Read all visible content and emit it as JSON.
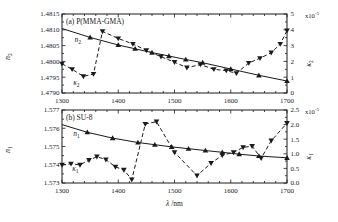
{
  "figure": {
    "xlabel": {
      "symbol": "λ",
      "rest": " /nm"
    },
    "background": "#ffffff",
    "ink_color": "#1a1a1a"
  },
  "chart_data": [
    {
      "type": "line",
      "panel_label": "(a) P(MMA-GMA)",
      "xlim": [
        1300,
        1700
      ],
      "x_major_ticks": [
        1300,
        1400,
        1500,
        1600,
        1700
      ],
      "x_tick_labels": [
        "1300",
        "1400",
        "1500",
        "1600",
        "1700"
      ],
      "x_minor_step": 20,
      "grid": false,
      "left_axis": {
        "label_main": "n",
        "label_sub": "2",
        "lim": [
          1.479,
          1.4815
        ],
        "ticks": [
          1.479,
          1.4795,
          1.48,
          1.4805,
          1.481,
          1.4815
        ],
        "tick_labels": [
          "1.4790",
          "1.4795",
          "1.4800",
          "1.4805",
          "1.4810",
          "1.4815"
        ],
        "minor_step": 0.00025
      },
      "right_axis": {
        "label_main": "κ",
        "label_sub": "2",
        "lim": [
          0,
          5
        ],
        "ticks": [
          0,
          1,
          2,
          3,
          4,
          5
        ],
        "tick_labels": [
          "0",
          "1",
          "2",
          "3",
          "4",
          "5"
        ],
        "minor_step": 0.5,
        "multiplier_base": "x10",
        "multiplier_exp": "-5"
      },
      "series": [
        {
          "name": "n2",
          "axis": "left",
          "style": "solid",
          "marker": "triangle-up",
          "line_x": [
            1300,
            1350,
            1400,
            1430,
            1460,
            1490,
            1520,
            1550,
            1600,
            1650,
            1700
          ],
          "line_y": [
            1.48104,
            1.48076,
            1.48052,
            1.4804,
            1.48028,
            1.48017,
            1.48006,
            1.47996,
            1.47976,
            1.47956,
            1.47938
          ],
          "points_x": [
            1350,
            1400,
            1430,
            1460,
            1490,
            1520,
            1550,
            1600,
            1650,
            1700
          ],
          "points_y": [
            1.48076,
            1.48052,
            1.4804,
            1.48028,
            1.48017,
            1.48006,
            1.47996,
            1.47976,
            1.47956,
            1.47938
          ],
          "annotation": {
            "main": "n",
            "sub": "2",
            "x": 1322,
            "y": 1.48062
          }
        },
        {
          "name": "kappa2",
          "axis": "right",
          "style": "dashed",
          "marker": "triangle-down",
          "line_x": [
            1300,
            1318,
            1338,
            1356,
            1372,
            1400,
            1426,
            1450,
            1476,
            1500,
            1522,
            1546,
            1570,
            1592,
            1610,
            1632,
            1652,
            1672,
            1688,
            1700
          ],
          "line_y": [
            1.85,
            1.5,
            1.05,
            1.2,
            3.9,
            3.45,
            3.1,
            2.7,
            2.3,
            1.95,
            1.6,
            1.8,
            1.5,
            1.42,
            1.25,
            1.9,
            2.2,
            2.55,
            3.1,
            3.95
          ],
          "points_x": [
            1300,
            1318,
            1338,
            1356,
            1372,
            1400,
            1426,
            1450,
            1476,
            1500,
            1522,
            1546,
            1570,
            1592,
            1610,
            1632,
            1652,
            1672,
            1688,
            1700
          ],
          "points_y": [
            1.85,
            1.5,
            1.05,
            1.2,
            3.9,
            3.45,
            3.1,
            2.7,
            2.3,
            1.95,
            1.6,
            1.8,
            1.5,
            1.42,
            1.25,
            1.9,
            2.2,
            2.55,
            3.1,
            3.95
          ],
          "annotation": {
            "main": "κ",
            "sub": "2",
            "x": 1320,
            "y": 0.52
          }
        }
      ]
    },
    {
      "type": "line",
      "panel_label": "(b) SU-8",
      "xlim": [
        1300,
        1700
      ],
      "x_major_ticks": [
        1300,
        1400,
        1500,
        1600,
        1700
      ],
      "x_tick_labels": [
        "1300",
        "1400",
        "1500",
        "1600",
        "1700"
      ],
      "x_minor_step": 20,
      "grid": false,
      "left_axis": {
        "label_main": "n",
        "label_sub": "1",
        "lim": [
          1.573,
          1.577
        ],
        "ticks": [
          1.573,
          1.574,
          1.575,
          1.576,
          1.577
        ],
        "tick_labels": [
          "1.573",
          "1.574",
          "1.575",
          "1.576",
          "1.577"
        ],
        "minor_step": 0.0005
      },
      "right_axis": {
        "label_main": "κ",
        "label_sub": "1",
        "lim": [
          0,
          2.5
        ],
        "ticks": [
          0,
          0.5,
          1,
          1.5,
          2,
          2.5
        ],
        "tick_labels": [
          "0.0",
          "0.5",
          "1.0",
          "1.5",
          "2.0",
          "2.5"
        ],
        "minor_step": 0.25,
        "multiplier_base": "x10",
        "multiplier_exp": "-5"
      },
      "series": [
        {
          "name": "n1",
          "axis": "left",
          "style": "solid",
          "marker": "triangle-up",
          "line_x": [
            1300,
            1345,
            1390,
            1435,
            1465,
            1495,
            1525,
            1555,
            1585,
            1615,
            1650,
            1700
          ],
          "line_y": [
            1.5762,
            1.57578,
            1.57546,
            1.57522,
            1.5751,
            1.57498,
            1.57488,
            1.57478,
            1.57468,
            1.57458,
            1.57448,
            1.57438
          ],
          "points_x": [
            1345,
            1390,
            1435,
            1465,
            1495,
            1525,
            1555,
            1585,
            1615,
            1650,
            1700
          ],
          "points_y": [
            1.57578,
            1.57546,
            1.57522,
            1.5751,
            1.57498,
            1.57488,
            1.57478,
            1.57468,
            1.57458,
            1.57448,
            1.57438
          ],
          "annotation": {
            "main": "n",
            "sub": "1",
            "x": 1320,
            "y": 1.5756
          }
        },
        {
          "name": "kappa1",
          "axis": "right",
          "style": "dashed",
          "marker": "triangle-down",
          "line_x": [
            1300,
            1316,
            1332,
            1348,
            1362,
            1378,
            1395,
            1410,
            1424,
            1448,
            1468,
            1500,
            1540,
            1565,
            1585,
            1605,
            1622,
            1638,
            1654,
            1672,
            1700
          ],
          "line_y": [
            0.62,
            0.66,
            0.62,
            0.78,
            0.9,
            0.8,
            0.55,
            0.45,
            0.12,
            2.02,
            2.1,
            1.05,
            0.25,
            0.68,
            0.95,
            1.05,
            1.22,
            1.26,
            0.85,
            1.45,
            2.05
          ],
          "points_x": [
            1300,
            1316,
            1332,
            1348,
            1362,
            1378,
            1395,
            1410,
            1424,
            1448,
            1468,
            1500,
            1540,
            1565,
            1585,
            1605,
            1622,
            1638,
            1654,
            1672,
            1700
          ],
          "points_y": [
            0.62,
            0.66,
            0.62,
            0.78,
            0.9,
            0.8,
            0.55,
            0.45,
            0.12,
            2.02,
            2.1,
            1.05,
            0.25,
            0.68,
            0.95,
            1.05,
            1.22,
            1.26,
            0.85,
            1.45,
            2.05
          ],
          "annotation": {
            "main": "κ",
            "sub": "1",
            "x": 1318,
            "y": 0.42
          }
        }
      ]
    }
  ]
}
